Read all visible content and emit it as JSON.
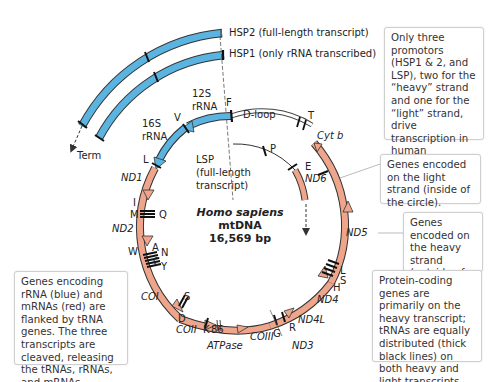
{
  "colors": {
    "rrna_blue": "#5bb3df",
    "mrna_salmon": "#eea58b",
    "outline": "#333333",
    "trna_tick": "#111111",
    "callout_border": "#cfcfcf"
  },
  "transcripts": {
    "hsp2": "HSP2 (full-length transcript)",
    "hsp1": "HSP1 (only rRNA transcribed)",
    "term": "Term",
    "lsp_line1": "LSP",
    "lsp_line2": "(full-length",
    "lsp_line3": "transcript)",
    "dloop": "D-loop"
  },
  "center_label": {
    "species": "Homo sapiens",
    "molecule": "mtDNA",
    "size": "16,569 bp"
  },
  "rrna_genes": {
    "s12_line1": "12S",
    "s12_line2": "rRNA",
    "s16_line1": "16S",
    "s16_line2": "rRNA"
  },
  "protein_genes": {
    "nd1": "ND1",
    "nd2": "ND2",
    "coi": "COI",
    "coii": "COII",
    "atpase_nums": "86",
    "atpase": "ATPase",
    "coiii": "COIII",
    "nd3": "ND3",
    "nd4l": "ND4L",
    "nd4": "ND4",
    "nd5": "ND5",
    "nd6": "ND6",
    "cytb": "Cyt b"
  },
  "trna_labels": {
    "F": "F",
    "V": "V",
    "L1": "L",
    "I": "I",
    "M": "M",
    "Q": "Q",
    "W": "W",
    "A": "A",
    "N": "N",
    "C": "C",
    "Y": "Y",
    "S1": "S",
    "D": "D",
    "K": "K",
    "G": "G",
    "R": "R",
    "H": "H",
    "S2": "S",
    "L2": "L",
    "E": "E",
    "T": "T",
    "P": "P"
  },
  "callouts": {
    "promoters": "Only three promotors (HSP1 & 2, and LSP), two for the “heavy” strand and one for the “light” strand, drive transcription in human mitochondria.",
    "light_strand": "Genes encoded on the light strand (inside of the circle).",
    "heavy_strand": "Genes encoded on the heavy strand (outside of the circle).",
    "protein_coding": "Protein-coding genes are primarily on the heavy transcript; tRNAs are equally distributed (thick black lines) on both heavy and light transcripts.",
    "flanking": "Genes encoding rRNA (blue) and mRNAs (red) are flanked by tRNA genes. The three transcripts are cleaved, releasing the tRNAs, rRNAs, and mRNAs."
  }
}
